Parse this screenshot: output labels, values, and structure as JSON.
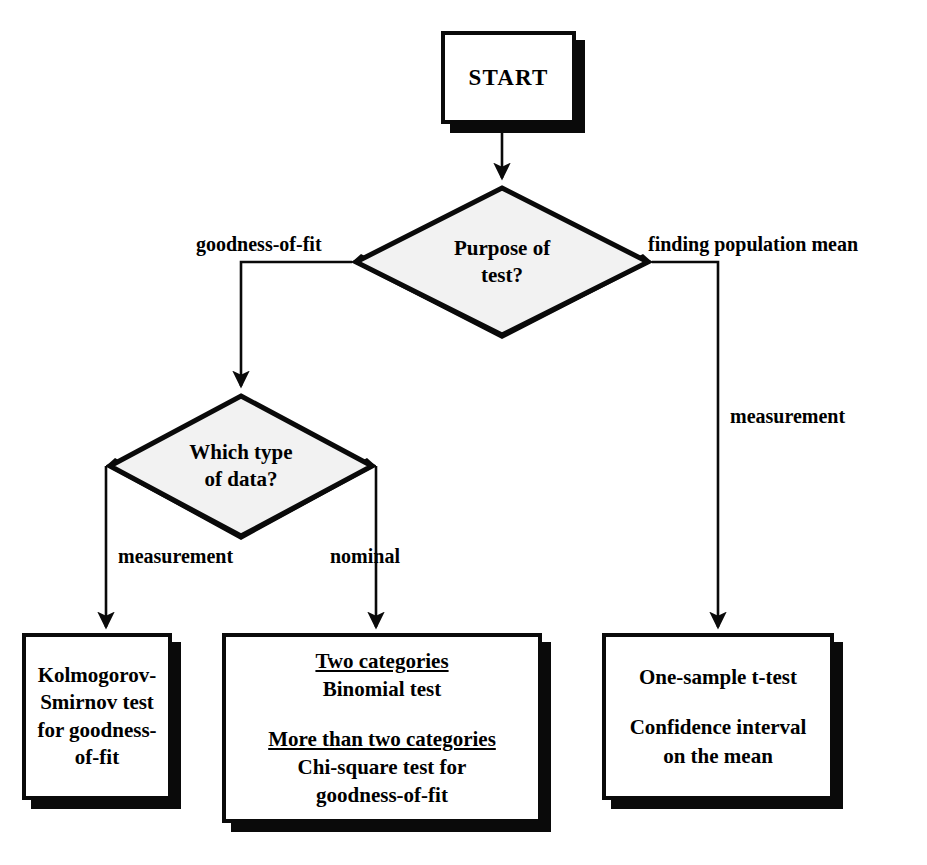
{
  "diagram": {
    "type": "flowchart",
    "colors": {
      "background": "#ffffff",
      "stroke": "#0a0a0a",
      "fill": "#ffffff",
      "shadow": "#0a0a0a"
    }
  },
  "nodes": {
    "start": {
      "label": "START",
      "shape": "rectangle"
    },
    "purpose": {
      "line1": "Purpose of",
      "line2": "test?",
      "shape": "diamond"
    },
    "datatype": {
      "line1": "Which type",
      "line2": "of data?",
      "shape": "diamond"
    },
    "ks_test": {
      "line1": "Kolmogorov-",
      "line2": "Smirnov test",
      "line3": "for goodness-",
      "line4": "of-fit",
      "shape": "rectangle"
    },
    "categories": {
      "head1": "Two categories",
      "body1": "Binomial test",
      "head2": "More than two categories",
      "body2a": "Chi-square test for",
      "body2b": "goodness-of-fit",
      "shape": "rectangle"
    },
    "mean_tests": {
      "line1": "One-sample t-test",
      "line2": "Confidence interval",
      "line3": "on the mean",
      "shape": "rectangle"
    }
  },
  "edges": {
    "start_to_purpose": {
      "label": ""
    },
    "purpose_to_datatype": {
      "label": "goodness-of-fit"
    },
    "purpose_to_mean": {
      "label": "finding population mean"
    },
    "mean_branch_second": {
      "label": "measurement"
    },
    "datatype_to_ks": {
      "label": "measurement"
    },
    "datatype_to_categories": {
      "label": "nominal"
    }
  }
}
